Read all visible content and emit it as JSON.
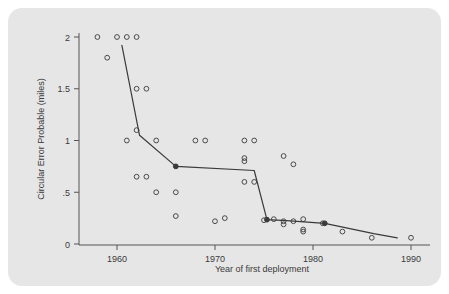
{
  "chart_data": {
    "type": "scatter",
    "title": "",
    "xlabel": "Year of first deployment",
    "ylabel": "Circular Error Probable (miles)",
    "xlim": [
      1957,
      1991
    ],
    "ylim": [
      0,
      2.08
    ],
    "grid": false,
    "legend": null,
    "xticks": [
      1960,
      1970,
      1980,
      1990
    ],
    "xtick_labels": [
      "1960",
      "1970",
      "1980",
      "1990"
    ],
    "yticks": [
      0,
      0.5,
      1,
      1.5,
      2
    ],
    "ytick_labels": [
      "0",
      ".5",
      "1",
      "1.5",
      "2"
    ],
    "points": [
      {
        "x": 1958,
        "y": 2.0
      },
      {
        "x": 1959,
        "y": 1.8
      },
      {
        "x": 1960,
        "y": 2.0
      },
      {
        "x": 1961,
        "y": 2.0
      },
      {
        "x": 1962,
        "y": 2.0
      },
      {
        "x": 1961,
        "y": 1.0
      },
      {
        "x": 1962,
        "y": 1.5
      },
      {
        "x": 1963,
        "y": 1.5
      },
      {
        "x": 1962,
        "y": 1.1
      },
      {
        "x": 1964,
        "y": 1.0
      },
      {
        "x": 1962,
        "y": 0.65
      },
      {
        "x": 1963,
        "y": 0.65
      },
      {
        "x": 1964,
        "y": 0.5
      },
      {
        "x": 1966,
        "y": 0.5
      },
      {
        "x": 1966,
        "y": 0.27
      },
      {
        "x": 1968,
        "y": 1.0
      },
      {
        "x": 1969,
        "y": 1.0
      },
      {
        "x": 1970,
        "y": 0.22
      },
      {
        "x": 1971,
        "y": 0.25
      },
      {
        "x": 1973,
        "y": 1.0
      },
      {
        "x": 1974,
        "y": 1.0
      },
      {
        "x": 1973,
        "y": 0.83
      },
      {
        "x": 1973,
        "y": 0.8
      },
      {
        "x": 1973,
        "y": 0.6
      },
      {
        "x": 1974,
        "y": 0.6
      },
      {
        "x": 1975,
        "y": 0.23
      },
      {
        "x": 1976,
        "y": 0.24
      },
      {
        "x": 1977,
        "y": 0.85
      },
      {
        "x": 1978,
        "y": 0.77
      },
      {
        "x": 1977,
        "y": 0.22
      },
      {
        "x": 1977,
        "y": 0.19
      },
      {
        "x": 1978,
        "y": 0.22
      },
      {
        "x": 1979,
        "y": 0.24
      },
      {
        "x": 1979,
        "y": 0.14
      },
      {
        "x": 1979,
        "y": 0.12
      },
      {
        "x": 1981,
        "y": 0.2
      },
      {
        "x": 1983,
        "y": 0.12
      },
      {
        "x": 1986,
        "y": 0.06
      },
      {
        "x": 1990,
        "y": 0.06
      }
    ],
    "trend_line": {
      "name": "best-practice frontier",
      "vertices": [
        {
          "x": 1960.5,
          "y": 1.92
        },
        {
          "x": 1962.3,
          "y": 1.05
        },
        {
          "x": 1966.0,
          "y": 0.75
        },
        {
          "x": 1974.0,
          "y": 0.71
        },
        {
          "x": 1975.3,
          "y": 0.235
        },
        {
          "x": 1977.3,
          "y": 0.225
        },
        {
          "x": 1981.2,
          "y": 0.2
        },
        {
          "x": 1986.2,
          "y": 0.1
        },
        {
          "x": 1988.6,
          "y": 0.06
        }
      ],
      "marked_vertices": [
        {
          "x": 1966.0,
          "y": 0.75
        },
        {
          "x": 1975.3,
          "y": 0.235
        },
        {
          "x": 1981.2,
          "y": 0.2
        }
      ]
    },
    "colors": {
      "panel_background": "#e6e6e6",
      "figure_background": "#ffffff",
      "point_stroke": "#4a4a4a",
      "line_stroke": "#3a3a3a",
      "axis": "#555555",
      "text": "#3a3a3a"
    }
  }
}
